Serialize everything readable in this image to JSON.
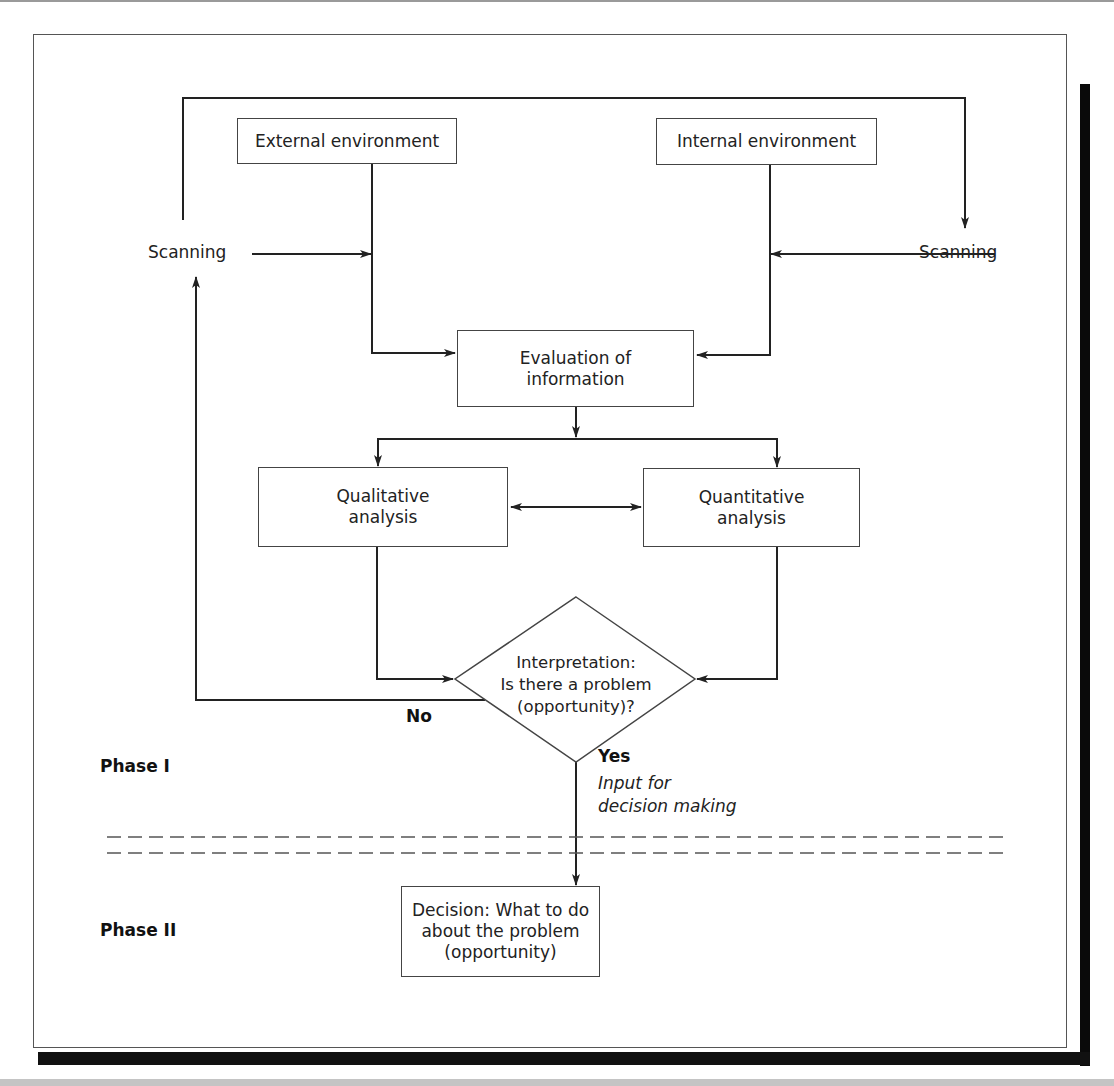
{
  "diagram": {
    "type": "flowchart",
    "nodes": {
      "external_environment": "External environment",
      "internal_environment": "Internal environment",
      "scanning_left": "Scanning",
      "scanning_right": "Scanning",
      "evaluation": {
        "line1": "Evaluation of",
        "line2": "information"
      },
      "qualitative": {
        "line1": "Qualitative",
        "line2": "analysis"
      },
      "quantitative": {
        "line1": "Quantitative",
        "line2": "analysis"
      },
      "interpretation": {
        "line1": "Interpretation:",
        "line2": "Is there a problem",
        "line3": "(opportunity)?"
      },
      "decision": {
        "line1": "Decision: What to do",
        "line2": "about the problem",
        "line3": "(opportunity)"
      }
    },
    "edge_labels": {
      "no": "No",
      "yes": "Yes",
      "input_line1": "Input for",
      "input_line2": "decision making"
    },
    "phases": {
      "phase1": "Phase I",
      "phase2": "Phase II"
    },
    "edges": [
      [
        "scanning_left",
        "external_environment_line"
      ],
      [
        "scanning_right",
        "internal_environment_line"
      ],
      [
        "external_environment",
        "evaluation"
      ],
      [
        "internal_environment",
        "evaluation"
      ],
      [
        "scanning_left",
        "scanning_right (top loop)"
      ],
      [
        "evaluation",
        "qualitative"
      ],
      [
        "evaluation",
        "quantitative"
      ],
      [
        "qualitative",
        "quantitative (bidirectional)"
      ],
      [
        "qualitative",
        "interpretation"
      ],
      [
        "quantitative",
        "interpretation"
      ],
      [
        "interpretation",
        "scanning_left (No)"
      ],
      [
        "interpretation",
        "decision (Yes)"
      ]
    ]
  }
}
